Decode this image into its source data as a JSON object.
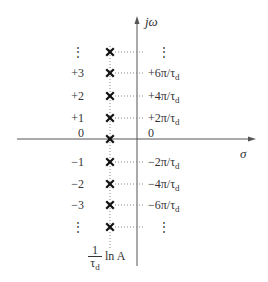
{
  "diagram": {
    "type": "pole-zero s-plane plot",
    "axes": {
      "vertical_label": "jω",
      "horizontal_label": "σ"
    },
    "rows": [
      {
        "index": "⋮",
        "value": "⋮",
        "y": 52
      },
      {
        "index": "+3",
        "value": "+6π/τ",
        "sub": "d",
        "y": 73
      },
      {
        "index": "+2",
        "value": "+4π/τ",
        "sub": "d",
        "y": 96
      },
      {
        "index": "+1",
        "value": "+2π/τ",
        "sub": "d",
        "y": 118
      },
      {
        "index": "0",
        "value": "0",
        "y": 133
      },
      {
        "index": "−1",
        "value": "−2π/τ",
        "sub": "d",
        "y": 162
      },
      {
        "index": "−2",
        "value": "−4π/τ",
        "sub": "d",
        "y": 184
      },
      {
        "index": "−3",
        "value": "−6π/τ",
        "sub": "d",
        "y": 205
      },
      {
        "index": "⋮",
        "value": "⋮",
        "y": 227
      }
    ],
    "pole_marker": "×",
    "pole_x_label": {
      "numerator": "1",
      "denominator": "τ",
      "denominator_sub": "d",
      "suffix": "ln A"
    },
    "colors": {
      "axis": "#555555",
      "pole": "#111111",
      "dotted": "#888888"
    }
  }
}
